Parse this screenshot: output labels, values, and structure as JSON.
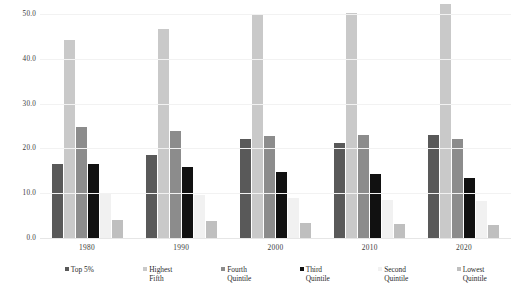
{
  "chart_data": {
    "type": "bar",
    "title": "",
    "xlabel": "",
    "ylabel": "",
    "categories": [
      "1980",
      "1990",
      "2000",
      "2010",
      "2020"
    ],
    "ylim": [
      0.0,
      50.0
    ],
    "yticks": [
      "0.0",
      "10.0",
      "20.0",
      "30.0",
      "40.0",
      "50.0"
    ],
    "ytick_values": [
      0.0,
      10.0,
      20.0,
      30.0,
      40.0,
      50.0
    ],
    "grid": false,
    "legend_position": "bottom",
    "series": [
      {
        "name": "Top 5%",
        "color": "#595959",
        "values": [
          16.5,
          18.5,
          22.1,
          21.3,
          23.0
        ]
      },
      {
        "name": "Highest\nFifth",
        "color": "#c9c9c9",
        "values": [
          44.2,
          46.6,
          49.8,
          50.2,
          52.2
        ]
      },
      {
        "name": "Fourth\nQuintile",
        "color": "#8c8c8c",
        "values": [
          24.8,
          23.9,
          22.8,
          23.0,
          22.2
        ]
      },
      {
        "name": "Third\nQuintile",
        "color": "#111111",
        "values": [
          16.6,
          15.8,
          14.8,
          14.4,
          13.5
        ]
      },
      {
        "name": "Second\nQuintile",
        "color": "#f1f1f1",
        "values": [
          10.1,
          9.6,
          9.0,
          8.5,
          8.3
        ]
      },
      {
        "name": "Lowest\nQuintile",
        "color": "#bfbfbf",
        "values": [
          4.1,
          3.7,
          3.4,
          3.2,
          2.9
        ]
      }
    ]
  },
  "caption": ""
}
